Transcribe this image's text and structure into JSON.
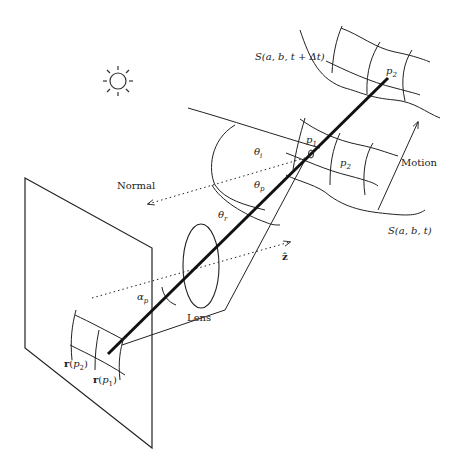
{
  "diagram": {
    "labels": {
      "surface_t_dt": "S(a, b, t + Δt)",
      "surface_t": "S(a, b, t)",
      "p2_top": "p",
      "p2_top_sub": "2",
      "p1": "p",
      "p1_sub": "1",
      "p2_mid": "p",
      "p2_mid_sub": "2",
      "motion": "Motion",
      "theta_i": "θ",
      "theta_i_sub": "i",
      "theta_p": "θ",
      "theta_p_sub": "p",
      "theta_r": "θ",
      "theta_r_sub": "r",
      "normal": "Normal",
      "z_hat": "ẑ",
      "alpha_p": "α",
      "alpha_p_sub": "p",
      "lens": "Lens",
      "r_p2": "r(p",
      "r_p2_sub": "2",
      "r_p2_close": ")",
      "r_p1": "r(p",
      "r_p1_sub": "1",
      "r_p1_close": ")"
    },
    "icons": {
      "light_source": "sun-icon"
    },
    "colors": {
      "stroke": "#222222",
      "background": "#ffffff"
    }
  }
}
